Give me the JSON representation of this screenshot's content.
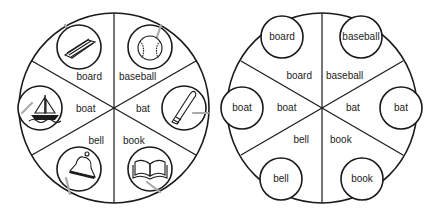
{
  "left_wheel": {
    "description": "Picture wheel with paper clips",
    "center": [
      114,
      108
    ],
    "radius": 95,
    "sectors": [
      {
        "word": "board",
        "picture": "board-icon"
      },
      {
        "word": "baseball",
        "picture": "baseball-icon"
      },
      {
        "word": "bat",
        "picture": "bat-icon"
      },
      {
        "word": "book",
        "picture": "book-icon"
      },
      {
        "word": "bell",
        "picture": "bell-icon"
      },
      {
        "word": "boat",
        "picture": "boat-icon"
      }
    ]
  },
  "right_wheel": {
    "description": "Word wheel with word circles",
    "center": [
      322,
      108
    ],
    "radius": 95,
    "sectors": [
      {
        "word": "board",
        "circle_word": "board"
      },
      {
        "word": "baseball",
        "circle_word": "baseball"
      },
      {
        "word": "bat",
        "circle_word": "bat"
      },
      {
        "word": "book",
        "circle_word": "book"
      },
      {
        "word": "bell",
        "circle_word": "bell"
      },
      {
        "word": "boat",
        "circle_word": "boat"
      }
    ]
  },
  "colors": {
    "ink": "#1a1a1a",
    "clip": "#aaaaaa",
    "background": "#ffffff"
  }
}
